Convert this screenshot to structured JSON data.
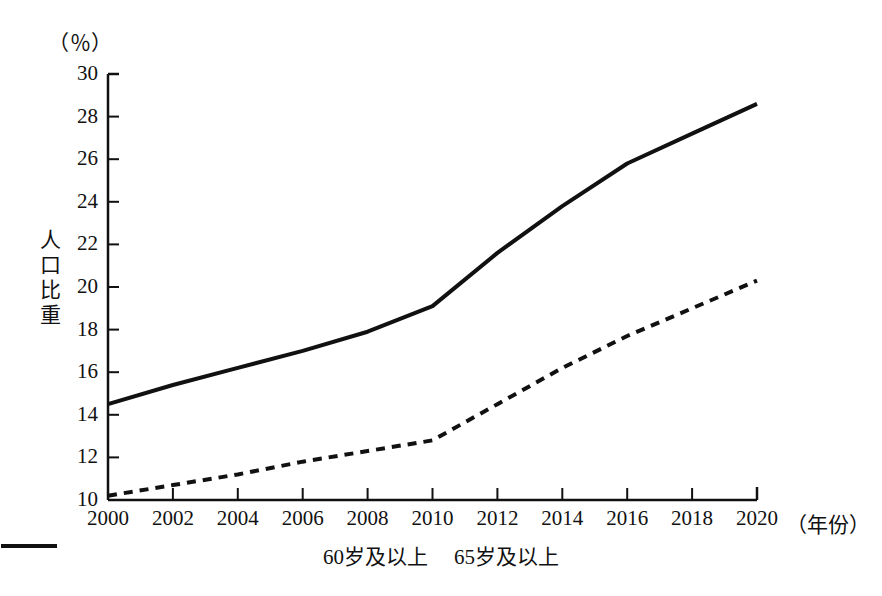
{
  "chart_data": {
    "type": "line",
    "title": "",
    "unit_label": "（％）",
    "ylabel": "人口比重",
    "xlabel": "（年份）",
    "x": [
      2000,
      2002,
      2004,
      2006,
      2008,
      2010,
      2012,
      2014,
      2016,
      2018,
      2020
    ],
    "xtick_labels": [
      "2000",
      "2002",
      "2004",
      "2006",
      "2008",
      "2010",
      "2012",
      "2014",
      "2016",
      "2018",
      "2020"
    ],
    "ytick_labels": [
      "10",
      "12",
      "14",
      "16",
      "18",
      "20",
      "22",
      "24",
      "26",
      "28",
      "30"
    ],
    "yticks": [
      10,
      12,
      14,
      16,
      18,
      20,
      22,
      24,
      26,
      28,
      30
    ],
    "xlim": [
      2000,
      2020
    ],
    "ylim": [
      10,
      30
    ],
    "grid": false,
    "legend_position": "bottom-center",
    "series": [
      {
        "name": "60岁及以上",
        "style": "solid",
        "color": "#111111",
        "values": [
          14.5,
          15.4,
          16.2,
          17.0,
          17.9,
          19.1,
          21.6,
          23.8,
          25.8,
          27.2,
          28.6
        ]
      },
      {
        "name": "65岁及以上",
        "style": "dashed",
        "color": "#111111",
        "values": [
          10.2,
          10.7,
          11.2,
          11.8,
          12.3,
          12.8,
          14.5,
          16.2,
          17.7,
          19.0,
          20.3
        ]
      }
    ]
  },
  "legend": {
    "entries": [
      {
        "label": "60岁及以上"
      },
      {
        "label": "65岁及以上"
      }
    ]
  }
}
